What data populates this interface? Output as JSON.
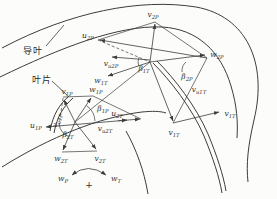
{
  "figure": {
    "type": "velocity-triangle-diagram",
    "annotations": {
      "guide_vane": "导叶",
      "blade": "叶片",
      "plus_sign": "+"
    },
    "colors": {
      "ink": "#3c3c3c",
      "paper": "#fcfcfa"
    },
    "labels": {
      "v2P": {
        "base": "v",
        "sub": "2P"
      },
      "u2P": {
        "base": "u",
        "sub": "2P"
      },
      "w2P": {
        "base": "w",
        "sub": "2P"
      },
      "vu2P": {
        "base": "v",
        "sub": "u2P"
      },
      "beta1T": {
        "base": "β",
        "sub": "1T"
      },
      "w1T": {
        "base": "w",
        "sub": "1T"
      },
      "beta2P": {
        "base": "β",
        "sub": "2P"
      },
      "vu1T": {
        "base": "v",
        "sub": "u1T"
      },
      "v1P": {
        "base": "v",
        "sub": "1P"
      },
      "w1P": {
        "base": "w",
        "sub": "1P"
      },
      "vu1P": {
        "base": "v",
        "sub": "u1P"
      },
      "beta1P": {
        "base": "β",
        "sub": "1P"
      },
      "u2T": {
        "base": "u",
        "sub": "2T"
      },
      "u1P": {
        "base": "u",
        "sub": "1P"
      },
      "vu2T": {
        "base": "v",
        "sub": "u2T"
      },
      "beta2T": {
        "base": "β",
        "sub": "2T"
      },
      "w2T": {
        "base": "w",
        "sub": "2T"
      },
      "v2T": {
        "base": "v",
        "sub": "2T"
      },
      "v1T_right": {
        "base": "v",
        "sub": "1T"
      },
      "v1T_lower": {
        "base": "v",
        "sub": "1T"
      },
      "wP": {
        "base": "w",
        "sub": "P"
      },
      "wT": {
        "base": "w",
        "sub": "T"
      }
    }
  }
}
